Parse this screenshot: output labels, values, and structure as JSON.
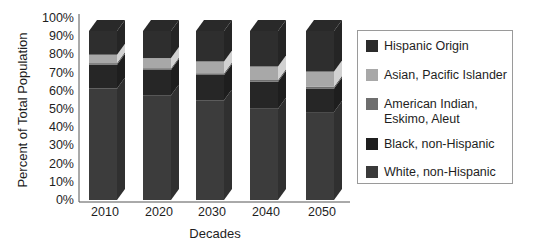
{
  "chart_data": {
    "type": "bar",
    "stacked": true,
    "style": "3d-stacked-100-percent",
    "title": "",
    "xlabel": "Decades",
    "ylabel": "Percent of Total Population",
    "categories": [
      "2010",
      "2020",
      "2030",
      "2040",
      "2050"
    ],
    "yticks": [
      "0%",
      "10%",
      "20%",
      "30%",
      "40%",
      "50%",
      "60%",
      "70%",
      "80%",
      "90%",
      "100%"
    ],
    "ylim": [
      0,
      100
    ],
    "grid": false,
    "legend_position": "right",
    "series": [
      {
        "name": "White, non-Hispanic",
        "color": "#3c3c3c",
        "values": [
          66,
          62,
          59,
          54,
          52
        ]
      },
      {
        "name": "Black, non-Hispanic",
        "color": "#262626",
        "values": [
          14,
          15,
          15,
          16,
          14
        ]
      },
      {
        "name": "American Indian, Eskimo, Aleut",
        "color": "#6e6e6e",
        "values": [
          1,
          1,
          1,
          1,
          1
        ]
      },
      {
        "name": "Asian, Pacific Islander",
        "color": "#a8a8a8",
        "values": [
          5,
          6,
          7,
          8,
          9
        ]
      },
      {
        "name": "Hispanic Origin",
        "color": "#2e2e2e",
        "values": [
          14,
          16,
          18,
          21,
          24
        ]
      }
    ]
  },
  "legend": {
    "items": [
      {
        "label": "Hispanic Origin",
        "color": "#2b2b2b"
      },
      {
        "label": "Asian, Pacific Islander",
        "color": "#a8a8a8"
      },
      {
        "label": "American Indian,\nEskimo, Aleut",
        "color": "#6e6e6e"
      },
      {
        "label": "Black, non-Hispanic",
        "color": "#1e1e1e"
      },
      {
        "label": "White, non-Hispanic",
        "color": "#3a3a3a"
      }
    ]
  },
  "axes": {
    "xlabel": "Decades",
    "ylabel": "Percent of Total Population"
  }
}
